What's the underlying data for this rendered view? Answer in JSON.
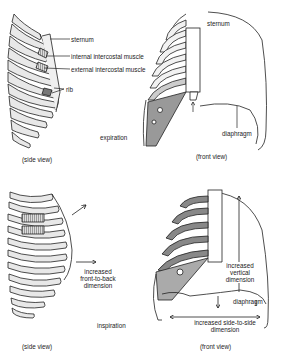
{
  "figure": {
    "panels": [
      {
        "id": "expiration-side",
        "view_label": "(side view)",
        "labels": [
          "sternum",
          "internal intercostal muscle",
          "external intercostal muscle",
          "rib"
        ]
      },
      {
        "id": "expiration-front",
        "view_label": "(front view)",
        "labels": [
          "sternum",
          "diaphragm"
        ]
      },
      {
        "id": "inspiration-side",
        "view_label": "(side view)",
        "labels": [
          "increased front-to-back dimension"
        ]
      },
      {
        "id": "inspiration-front",
        "view_label": "(front view)",
        "labels": [
          "increased vertical dimension",
          "diaphragm",
          "increased side-to-side dimension"
        ]
      }
    ],
    "phases": {
      "expiration": "expiration",
      "inspiration": "inspiration"
    },
    "text": {
      "sternum": "sternum",
      "internal_intercostal": "internal intercostal muscle",
      "external_intercostal": "external intercostal muscle",
      "rib": "rib",
      "expiration": "expiration",
      "side_view": "(side view)",
      "front_view": "(front view)",
      "diaphragm": "diaphragm",
      "inc_ftb_1": "increased",
      "inc_ftb_2": "front-to-back",
      "inc_ftb_3": "dimension",
      "inspiration": "inspiration",
      "inc_vert_1": "increased",
      "inc_vert_2": "vertical",
      "inc_vert_3": "dimension",
      "inc_sts_1": "increased side-to-side",
      "inc_sts_2": "dimension"
    }
  }
}
